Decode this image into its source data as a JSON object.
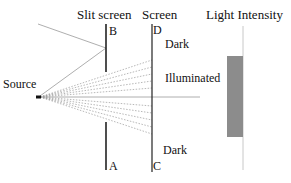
{
  "titles": {
    "slit_screen": "Slit screen",
    "screen": "Screen",
    "light_intensity": "Light Intensity"
  },
  "points": {
    "B": "B",
    "A": "A",
    "D": "D",
    "C": "C"
  },
  "labels": {
    "source": "Source",
    "dark_top": "Dark",
    "illuminated": "Illuminated",
    "dark_bottom": "Dark"
  },
  "colors": {
    "intensity_bar": "#8c8c8c",
    "lines": "#222222",
    "rays": "#9a9a9a",
    "axis": "#c8c8c8"
  }
}
